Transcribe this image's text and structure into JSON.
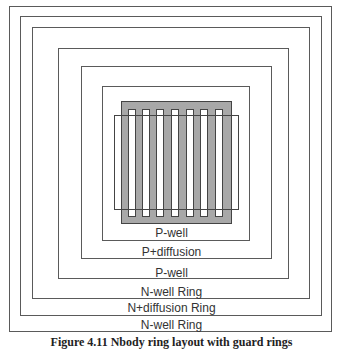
{
  "diagram": {
    "rings": [
      {
        "label": "N-well Ring",
        "left": 9,
        "top": 6,
        "right": 332,
        "bottom": 332,
        "label_top": 318
      },
      {
        "label": "N+diffusion Ring",
        "left": 20,
        "top": 16,
        "right": 322,
        "bottom": 316,
        "label_top": 301
      },
      {
        "label": "N-well Ring",
        "left": 32,
        "top": 27,
        "right": 310,
        "bottom": 299,
        "label_top": 285
      },
      {
        "label": "P-well",
        "left": 58,
        "top": 48,
        "right": 289,
        "bottom": 279,
        "label_top": 266
      },
      {
        "label": "P+diffusion",
        "left": 81,
        "top": 66,
        "right": 272,
        "bottom": 259,
        "label_top": 245
      },
      {
        "label": "P-well",
        "left": 102,
        "top": 86,
        "right": 250,
        "bottom": 241,
        "label_top": 226
      }
    ],
    "gate_region": {
      "left": 121,
      "top": 101,
      "right": 232,
      "bottom": 224,
      "color": "#a8a8a8"
    },
    "fingers": {
      "count": 7,
      "x_positions": [
        128,
        142,
        156,
        171,
        186,
        200,
        215
      ],
      "width": 8,
      "top": 109,
      "bottom": 217
    },
    "active_overlay": {
      "left": 114,
      "top": 115,
      "right": 239,
      "bottom": 210
    }
  },
  "caption": {
    "text": "Figure 4.11  Nbody ring layout with guard rings"
  }
}
